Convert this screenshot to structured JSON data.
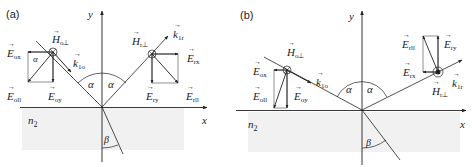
{
  "colors": {
    "line": "#222222",
    "medium_shade": "#f1f1f1",
    "background": "#ffffff"
  },
  "panels": [
    {
      "id": "a",
      "label": "(a)",
      "axis_x": "x",
      "axis_y": "y",
      "medium": "n",
      "medium_sub": "2",
      "angle_incident": "α",
      "angle_refracted": "β",
      "angle_small": "α",
      "h_incident": {
        "main": "H",
        "sub": "o⊥"
      },
      "k_incident": {
        "main": "k",
        "sub": "1o"
      },
      "e_ox": {
        "main": "E",
        "sub": "ox"
      },
      "e_opar": {
        "main": "E",
        "sub": "oll"
      },
      "e_oy": {
        "main": "E",
        "sub": "oy"
      },
      "h_reflected": {
        "main": "H",
        "sub": "r⊥"
      },
      "k_reflected": {
        "main": "k",
        "sub": "1r"
      },
      "e_rx": {
        "main": "E",
        "sub": "rx"
      },
      "e_ry": {
        "main": "E",
        "sub": "ry"
      },
      "e_rpar": {
        "main": "E",
        "sub": "rll"
      }
    },
    {
      "id": "b",
      "label": "(b)",
      "axis_x": "x",
      "axis_y": "y",
      "medium": "n",
      "medium_sub": "2",
      "angle_incident": "α",
      "angle_refracted": "β",
      "h_incident": {
        "main": "H",
        "sub": "o⊥"
      },
      "k_incident": {
        "main": "k",
        "sub": "1o"
      },
      "e_ox": {
        "main": "E",
        "sub": "ox"
      },
      "e_opar": {
        "main": "E",
        "sub": "oll"
      },
      "e_oy": {
        "main": "E",
        "sub": "oy"
      },
      "h_reflected": {
        "main": "H",
        "sub": "r⊥"
      },
      "k_reflected": {
        "main": "k",
        "sub": "1r"
      },
      "e_rx": {
        "main": "E",
        "sub": "rx"
      },
      "e_ry": {
        "main": "E",
        "sub": "ry"
      },
      "e_rpar": {
        "main": "E",
        "sub": "rll"
      }
    }
  ]
}
